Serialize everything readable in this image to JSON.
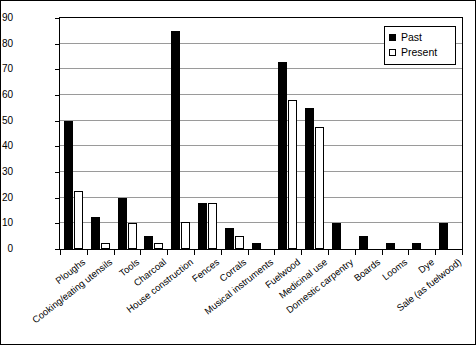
{
  "chart_data": {
    "type": "bar",
    "title": "",
    "xlabel": "",
    "ylabel": "Reported percentage who use",
    "ylim": [
      0,
      90
    ],
    "ytick_step": 10,
    "yticks": [
      0,
      10,
      20,
      30,
      40,
      50,
      60,
      70,
      80,
      90
    ],
    "grid": true,
    "legend_position": "top-right",
    "categories": [
      "Ploughs",
      "Cooking/eating utensils",
      "Tools",
      "Charcoal",
      "House construction",
      "Fences",
      "Corrals",
      "Musical instruments",
      "Fuelwood",
      "Medicinal use",
      "Domestic carpentry",
      "Boards",
      "Looms",
      "Dye",
      "Sale (as fuelwood)"
    ],
    "series": [
      {
        "name": "Past",
        "color": "#000000",
        "values": [
          50,
          12.5,
          20,
          5,
          85,
          18,
          8,
          2.5,
          73,
          55,
          10,
          5,
          2.5,
          2.5,
          10
        ]
      },
      {
        "name": "Present",
        "color": "#ffffff",
        "values": [
          22.5,
          2.5,
          10,
          2.5,
          10.5,
          18,
          5,
          0,
          58,
          47.5,
          0,
          0,
          0,
          0,
          0
        ]
      }
    ]
  },
  "legend": {
    "items": [
      {
        "label": "Past",
        "style": "past"
      },
      {
        "label": "Present",
        "style": "present"
      }
    ]
  }
}
